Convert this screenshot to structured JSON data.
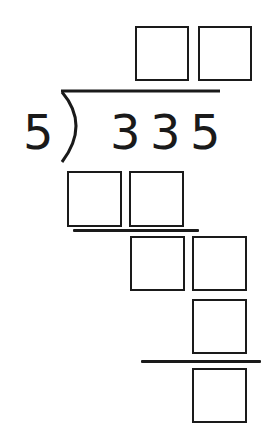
{
  "problem": {
    "type": "long-division",
    "divisor": "5",
    "dividend_digits": [
      "3",
      "3",
      "5"
    ]
  },
  "quotient": {
    "boxes": [
      "",
      ""
    ]
  },
  "steps": {
    "step1_product_boxes": [
      "",
      ""
    ],
    "step2_remainder_boxes": [
      "",
      ""
    ],
    "step3_product_boxes": [
      ""
    ],
    "step4_remainder_boxes": [
      ""
    ]
  },
  "colors": {
    "ink": "#1a1a1a",
    "background": "#ffffff"
  }
}
